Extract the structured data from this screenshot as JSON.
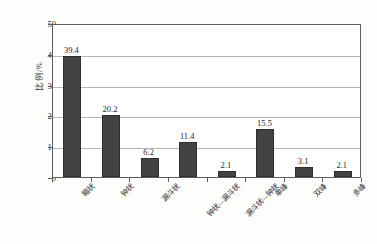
{
  "chart_data": {
    "type": "bar",
    "title": "",
    "subtitle": "",
    "xlabel": "",
    "ylabel": "比例/%",
    "ylim": [
      0,
      50
    ],
    "yticks": [
      0,
      10,
      20,
      30,
      40,
      50
    ],
    "ytick_labels": [
      "0",
      "10",
      "20",
      "30",
      "40",
      "50"
    ],
    "grid": true,
    "legend": false,
    "legend_position": "none",
    "categories": [
      "箱状",
      "钟状",
      "漏斗状",
      "钟状—漏斗状",
      "漏斗状—钟状",
      "单峰",
      "双峰",
      "多峰"
    ],
    "values": [
      39.4,
      20.2,
      6.2,
      11.4,
      2.1,
      15.5,
      3.1,
      2.1
    ],
    "data_labels": [
      "39.4",
      "20.2",
      "6.2",
      "11.4",
      "2.1",
      "15.5",
      "3.1",
      "2.1"
    ],
    "bar_color": "#434343",
    "bar_edge_color": "#2e2e2e",
    "grid_color": "#b6b6b6",
    "axis_color": "#5c5c5c",
    "background_color": "#fdfdfc"
  }
}
